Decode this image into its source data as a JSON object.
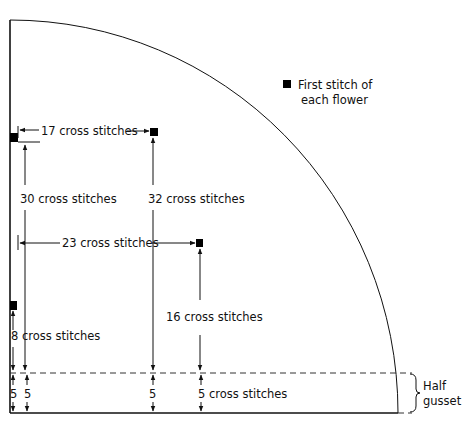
{
  "diagram": {
    "legend": {
      "icon": "filled-square-icon",
      "line1": "First stitch of",
      "line2": "each flower"
    },
    "measurements": {
      "h17": "17 cross stitches",
      "v30": "30 cross stitches",
      "v32": "32 cross stitches",
      "h23": "23 cross stitches",
      "v16": "16 cross stitches",
      "v8": "8 cross stitches",
      "g1": "5",
      "g2": "5",
      "g3": "5",
      "g4": "5 cross stitches"
    },
    "gusset": {
      "line1": "Half",
      "line2": "gusset"
    }
  }
}
